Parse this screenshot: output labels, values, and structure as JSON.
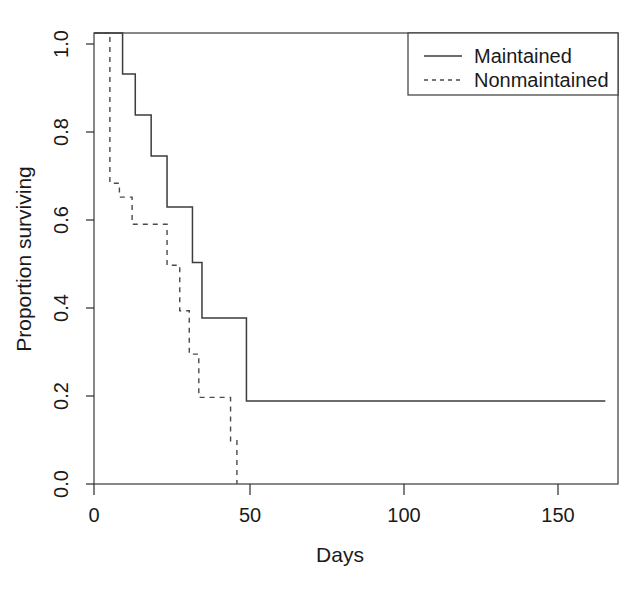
{
  "chart_data": {
    "type": "line",
    "subtype": "kaplan-meier-step",
    "title": "",
    "xlabel": "Days",
    "ylabel": "Proportion surviving",
    "xlim": [
      0,
      165
    ],
    "ylim": [
      0.0,
      1.0
    ],
    "xticks": [
      0,
      50,
      100,
      150
    ],
    "xtick_labels": [
      "0",
      "50",
      "100",
      "150"
    ],
    "yticks": [
      0.0,
      0.2,
      0.4,
      0.6,
      0.8,
      1.0
    ],
    "ytick_labels": [
      "0.0",
      "0.2",
      "0.4",
      "0.6",
      "0.8",
      "1.0"
    ],
    "grid": false,
    "legend_position": "top-right",
    "series": [
      {
        "name": "Maintained",
        "style": "solid",
        "color": "#3c3c3c",
        "x": [
          0,
          9,
          13,
          18,
          23,
          31,
          34,
          48,
          161
        ],
        "y": [
          1.0,
          0.909,
          0.818,
          0.727,
          0.614,
          0.491,
          0.368,
          0.184,
          0.184
        ]
      },
      {
        "name": "Nonmaintained",
        "style": "dashed",
        "color": "#4a4a4a",
        "x": [
          0,
          5,
          8,
          12,
          23,
          27,
          30,
          33,
          43,
          45
        ],
        "y": [
          1.0,
          0.667,
          0.636,
          0.576,
          0.485,
          0.384,
          0.288,
          0.192,
          0.096,
          0.0
        ]
      }
    ]
  },
  "legend": {
    "entries": [
      {
        "label": "Maintained",
        "style": "solid"
      },
      {
        "label": "Nonmaintained",
        "style": "dashed"
      }
    ]
  }
}
